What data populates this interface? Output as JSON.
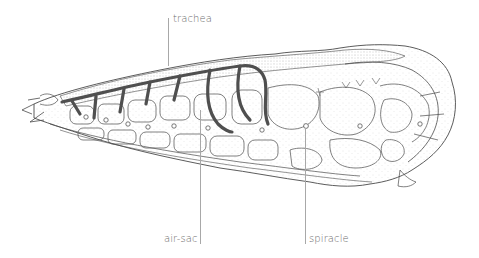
{
  "diagram": {
    "colors": {
      "background": "#ffffff",
      "outline": "#4a4a4a",
      "trachea": "#4f4f4f",
      "stipple": "#9a9a9a",
      "label_text": "#6b6b6b",
      "leader_line": "#a8a8a8"
    },
    "labels": [
      {
        "id": "trachea",
        "text": "trachea",
        "x": 173,
        "y": 19,
        "leader": {
          "x": 168,
          "y1": 18,
          "y2": 66
        }
      },
      {
        "id": "air-sac",
        "text": "air-sac",
        "x": 165,
        "y": 233,
        "leader": {
          "x": 200,
          "y1": 110,
          "y2": 244
        }
      },
      {
        "id": "spiracle",
        "text": "spiracle",
        "x": 308,
        "y": 233,
        "leader": {
          "x": 305,
          "y1": 160,
          "y2": 244
        }
      }
    ]
  }
}
